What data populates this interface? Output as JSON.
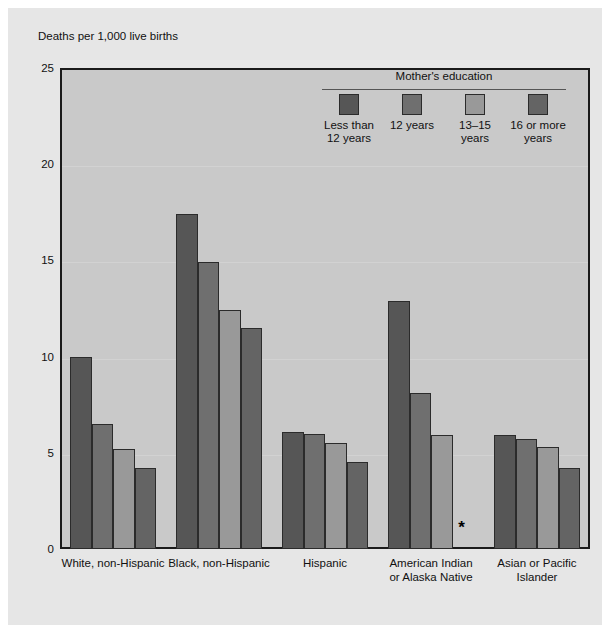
{
  "axis": {
    "y_title": "Deaths per 1,000 live births",
    "ticks": [
      "25",
      "20",
      "15",
      "10",
      "5",
      "0"
    ]
  },
  "legend": {
    "title": "Mother's education",
    "items": [
      {
        "label": "Less than\n12 years",
        "color": "#565656"
      },
      {
        "label": "12 years",
        "color": "#6f6f6f"
      },
      {
        "label": "13–15 years",
        "color": "#999999"
      },
      {
        "label": "16 or more\nyears",
        "color": "#646464"
      }
    ]
  },
  "footnote": {
    "asterisk": "*"
  },
  "chart_data": {
    "type": "bar",
    "title": "",
    "xlabel": "",
    "ylabel": "Deaths per 1,000 live births",
    "ylim": [
      0,
      25
    ],
    "yticks": [
      0,
      5,
      10,
      15,
      20,
      25
    ],
    "grid": true,
    "legend_position": "top-right",
    "legend_title": "Mother's education",
    "categories": [
      "White, non-Hispanic",
      "Black, non-Hispanic",
      "Hispanic",
      "American Indian\nor Alaska Native",
      "Asian or Pacific\nIslander"
    ],
    "series": [
      {
        "name": "Less than 12 years",
        "color": "#565656",
        "values": [
          10.0,
          17.4,
          6.1,
          12.9,
          5.9
        ]
      },
      {
        "name": "12 years",
        "color": "#6f6f6f",
        "values": [
          6.5,
          14.9,
          6.0,
          8.1,
          5.7
        ]
      },
      {
        "name": "13–15 years",
        "color": "#999999",
        "values": [
          5.2,
          12.4,
          5.5,
          5.9,
          5.3
        ]
      },
      {
        "name": "16 or more years",
        "color": "#646464",
        "values": [
          4.2,
          11.5,
          4.5,
          null,
          4.2
        ]
      }
    ],
    "annotations": [
      {
        "text": "*",
        "category": "American Indian\nor Alaska Native",
        "series": "16 or more years",
        "note": "figure does not meet standards of reliability"
      }
    ]
  }
}
